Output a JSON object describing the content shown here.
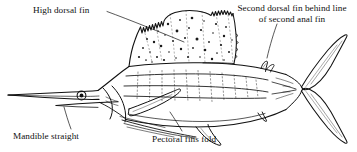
{
  "figure": {
    "background_color": "#ffffff",
    "ink_color": "#111111",
    "width": 357,
    "height": 152
  },
  "labels": {
    "high_dorsal_fin": "High dorsal fin",
    "second_dorsal_fin_line1": "Second dorsal fin behind line",
    "second_dorsal_fin_line2": "of second anal fin",
    "mandible_straight": "Mandible straight",
    "pectoral_fins_fold": "Pectoral fins fold"
  },
  "anatomy": {
    "parts": [
      "bill",
      "eye",
      "gill-cover",
      "high-dorsal-fin-sail",
      "second-dorsal-fin",
      "pectoral-fin",
      "pelvic-fins",
      "first-anal-fin",
      "second-anal-fin",
      "caudal-keel",
      "caudal-fin"
    ]
  }
}
